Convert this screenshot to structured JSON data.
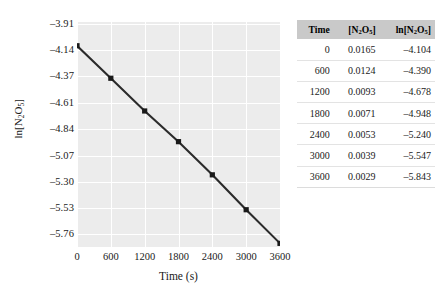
{
  "chart_data": {
    "type": "line",
    "title": "",
    "xlabel": "Time (s)",
    "ylabel": "ln[N2O5]",
    "ylabel_html": "ln[N<sub>2</sub>O<sub>5</sub>]",
    "x": [
      0,
      600,
      1200,
      1800,
      2400,
      3000,
      3600
    ],
    "values": [
      -4.104,
      -4.39,
      -4.678,
      -4.948,
      -5.24,
      -5.547,
      -5.843
    ],
    "series": [
      {
        "name": "ln[N2O5]",
        "values": [
          -4.104,
          -4.39,
          -4.678,
          -4.948,
          -5.24,
          -5.547,
          -5.843
        ]
      }
    ],
    "xlim": [
      0,
      3600
    ],
    "ylim": [
      -5.875,
      -3.895
    ],
    "xticks": [
      "0",
      "600",
      "1200",
      "1800",
      "2400",
      "3000",
      "3600"
    ],
    "xtick_values": [
      0,
      600,
      1200,
      1800,
      2400,
      3000,
      3600
    ],
    "yticks": [
      "–3.91",
      "–4.14",
      "–4.37",
      "–4.61",
      "–4.84",
      "–5.07",
      "–5.30",
      "–5.53",
      "–5.76"
    ],
    "ytick_values": [
      -3.91,
      -4.14,
      -4.37,
      -4.61,
      -4.84,
      -5.07,
      -5.3,
      -5.53,
      -5.76
    ],
    "grid": true,
    "legend": "none",
    "marker": "square",
    "line_color": "#2b2b2b",
    "marker_color": "#1a1a1a",
    "plot_background": "#ececec",
    "grid_color": "#ffffff"
  },
  "table": {
    "headers": {
      "time": "Time",
      "conc": "[N2O5]",
      "conc_html": "[N<sub>2</sub>O<sub>5</sub>]",
      "ln_conc": "ln[N2O5]",
      "ln_conc_html": "ln[N<sub>2</sub>O<sub>5</sub>]"
    },
    "header_background": "#c9c9c9",
    "rows": [
      {
        "time": "0",
        "conc": "0.0165",
        "ln": "–4.104"
      },
      {
        "time": "600",
        "conc": "0.0124",
        "ln": "–4.390"
      },
      {
        "time": "1200",
        "conc": "0.0093",
        "ln": "–4.678"
      },
      {
        "time": "1800",
        "conc": "0.0071",
        "ln": "–4.948"
      },
      {
        "time": "2400",
        "conc": "0.0053",
        "ln": "–5.240"
      },
      {
        "time": "3000",
        "conc": "0.0039",
        "ln": "–5.547"
      },
      {
        "time": "3600",
        "conc": "0.0029",
        "ln": "–5.843"
      }
    ]
  }
}
